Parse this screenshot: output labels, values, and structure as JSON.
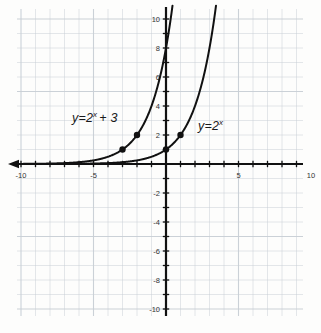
{
  "figure": {
    "background_color": "#fdfdfc",
    "grid_color": "#c9cfd6",
    "axis_color": "#111111",
    "curve_color": "#111111",
    "point_color": "#111111",
    "tick_label_color": "#333333"
  },
  "annotations": {
    "left_curve_label": {
      "lhs": "y=2",
      "exponent": "x",
      "suffix": "+ 3",
      "full": "y=2^x + 3"
    },
    "right_curve_label": {
      "lhs": "y=2",
      "exponent": "x",
      "suffix": "",
      "full": "y=2^x"
    }
  },
  "chart_data": {
    "type": "line",
    "title": "",
    "xlabel": "",
    "ylabel": "",
    "xlim": [
      -10.3,
      9.5
    ],
    "ylim": [
      -10.4,
      11.0
    ],
    "grid": true,
    "grid_step": 1,
    "legend": "inline-annotations",
    "x_ticks": [
      -10,
      -5,
      5,
      10
    ],
    "x_tick_labels": [
      "-10",
      "-5",
      "5",
      "10"
    ],
    "y_ticks": [
      -10,
      -8,
      -6,
      -4,
      -2,
      2,
      4,
      6,
      8,
      10
    ],
    "y_tick_labels": [
      "-10",
      "-8",
      "-6",
      "-4",
      "-2",
      "2",
      "4",
      "6",
      "8",
      "10"
    ],
    "tick_interval_major": 2,
    "axis_arrow": "left",
    "series": [
      {
        "name": "y=2^x + 3",
        "formula": "2^(x+3)",
        "color": "#111111",
        "marked_points": [
          {
            "x": -3,
            "y": 1
          },
          {
            "x": -2,
            "y": 2
          }
        ]
      },
      {
        "name": "y=2^x",
        "formula": "2^x",
        "color": "#111111",
        "marked_points": [
          {
            "x": 0,
            "y": 1
          },
          {
            "x": 1,
            "y": 2
          }
        ]
      }
    ]
  }
}
